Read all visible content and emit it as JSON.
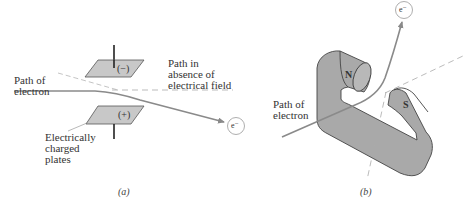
{
  "panel_a": {
    "caption": "(a)",
    "path_of_electron": "Path of\nelectron",
    "path_absent_field": "Path in\nabsence of\nelectrical field",
    "plates_label": "Electrically\ncharged\nplates",
    "top_plate_sign": "(−)",
    "bottom_plate_sign": "(+)",
    "electron": "e⁻"
  },
  "panel_b": {
    "caption": "(b)",
    "path_of_electron": "Path of\nelectron",
    "north_pole": "N",
    "south_pole": "S",
    "electron": "e⁻"
  },
  "colors": {
    "plate_fill": "#c8c8c8",
    "magnet_fill": "#a9a9a9",
    "path_line": "#8a8a8a",
    "outline": "#555555"
  }
}
